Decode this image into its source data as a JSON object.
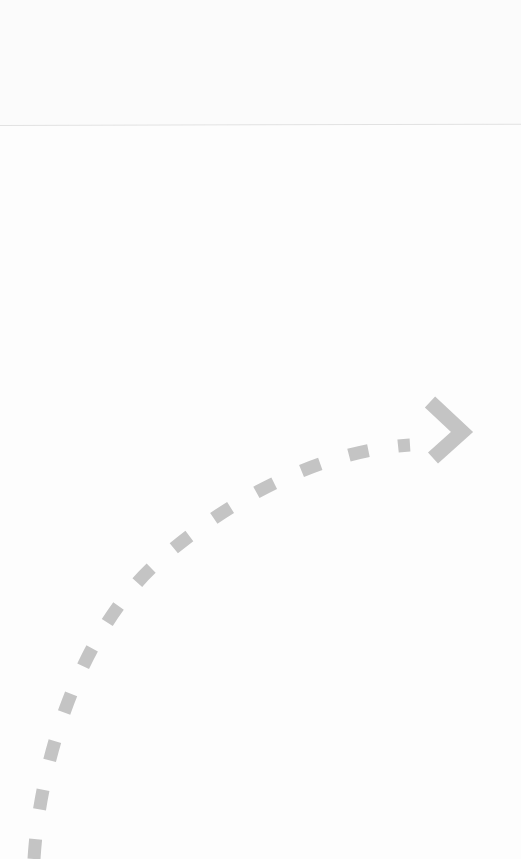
{
  "canvas": {
    "width": 521,
    "height": 859,
    "background": "#fdfdfd"
  },
  "divider": {
    "y": 125,
    "color": "#e2e2e2"
  },
  "arrow": {
    "color": "#c4c4c4",
    "stroke_width": 13,
    "dash": "20 30",
    "path": "M 34 859 C 40 760, 80 630, 160 560 S 330 450, 430 440",
    "head": "M 430 402 L 462 432 L 433 458"
  }
}
